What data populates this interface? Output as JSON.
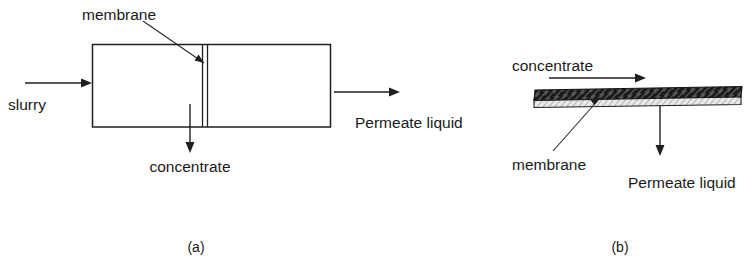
{
  "figure": {
    "title_text": "",
    "background_color": "#ffffff",
    "line_color": "#1f1f1f",
    "text_color": "#1a1a1a",
    "panels": [
      {
        "id": "a",
        "caption": "(a)",
        "description": "Dead-end / cross-section membrane module drawn as a rectangle with a vertical membrane",
        "labels": {
          "membrane": "membrane",
          "slurry": "slurry",
          "concentrate": "concentrate",
          "permeate": "Permeate liquid"
        }
      },
      {
        "id": "b",
        "caption": "(b)",
        "description": "Cross-flow membrane sheet drawn as a thin hatched slab",
        "labels": {
          "concentrate": "concentrate",
          "membrane": "membrane",
          "permeate": "Permeate liquid"
        }
      }
    ]
  }
}
